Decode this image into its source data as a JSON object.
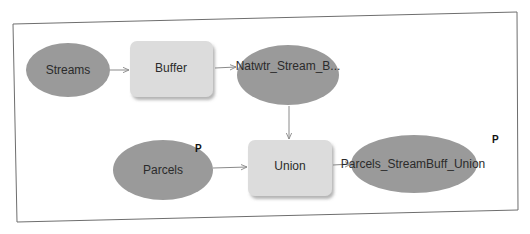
{
  "diagram": {
    "type": "geoprocessing-model",
    "colors": {
      "data_fill": "#9a9a9a",
      "tool_fill": "#dcdcdc",
      "connector": "#8a8a8a",
      "frame": "#6e6e6e",
      "text": "#2b2b2b"
    },
    "nodes": [
      {
        "id": "streams",
        "kind": "data",
        "label": "Streams",
        "parameter": false
      },
      {
        "id": "buffer",
        "kind": "tool",
        "label": "Buffer"
      },
      {
        "id": "natwtr",
        "kind": "data",
        "label": "Natwtr_Stream_B...",
        "parameter": false
      },
      {
        "id": "parcels",
        "kind": "data",
        "label": "Parcels",
        "parameter": true,
        "parameter_label": "P"
      },
      {
        "id": "union",
        "kind": "tool",
        "label": "Union"
      },
      {
        "id": "output",
        "kind": "data",
        "label": "Parcels_StreamBuff_Union",
        "parameter": true,
        "parameter_label": "P"
      }
    ],
    "edges": [
      {
        "from": "streams",
        "to": "buffer"
      },
      {
        "from": "buffer",
        "to": "natwtr"
      },
      {
        "from": "natwtr",
        "to": "union"
      },
      {
        "from": "parcels",
        "to": "union"
      },
      {
        "from": "union",
        "to": "output"
      }
    ]
  }
}
